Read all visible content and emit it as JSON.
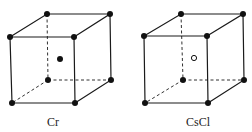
{
  "figure": {
    "cells": [
      {
        "label": "Cr",
        "center_atom": "filled",
        "corners": {
          "ftl": [
            10,
            37
          ],
          "ftr": [
            74,
            37
          ],
          "fbl": [
            12,
            103
          ],
          "fbr": [
            75,
            103
          ],
          "btl": [
            47,
            14
          ],
          "btr": [
            110,
            14
          ],
          "bbl": [
            48,
            80
          ],
          "bbr": [
            111,
            80
          ]
        },
        "center": [
          60,
          59
        ],
        "label_pos": [
          47,
          126
        ]
      },
      {
        "label": "CsCl",
        "center_atom": "open",
        "corners": {
          "ftl": [
            144,
            36
          ],
          "ftr": [
            207,
            36
          ],
          "fbl": [
            145,
            103
          ],
          "fbr": [
            208,
            103
          ],
          "btl": [
            181,
            14
          ],
          "btr": [
            243,
            14
          ],
          "bbl": [
            183,
            80
          ],
          "bbr": [
            244,
            80
          ]
        },
        "center": [
          194,
          58
        ],
        "label_pos": [
          186,
          126
        ]
      }
    ],
    "colors": {
      "line": "#1a1a1a",
      "atom": "#111111",
      "background": "#ffffff"
    }
  }
}
